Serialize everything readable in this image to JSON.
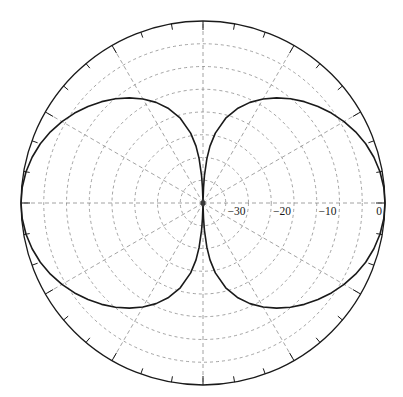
{
  "figure": {
    "name": "polar-radiation-pattern",
    "background_color": "#ffffff",
    "grid_color": "#8c8c8c",
    "curve_color": "#1a1a1a",
    "axis_color": "#1a1a1a",
    "center_x": 203,
    "center_y": 203,
    "outer_radius": 182
  },
  "chart_data": {
    "type": "line",
    "subtype": "polar",
    "title": "",
    "subtitle": "",
    "xlabel": "",
    "ylabel": "",
    "radial_axis": {
      "label": "",
      "unit": "dB",
      "tick_labels": [
        "-30",
        "-20",
        "-10",
        "0"
      ],
      "tick_values": [
        -30,
        -20,
        -10,
        0
      ],
      "tick_radii_px": [
        45.5,
        91,
        136.5,
        182
      ],
      "rlim": [
        -40,
        0
      ],
      "r_min": -40,
      "r_max": 0,
      "tick_label_angle_deg": 0,
      "minor_grid_values": [
        -35,
        -25,
        -15,
        -5
      ],
      "grid": true,
      "grid_style": "dashed"
    },
    "angular_axis": {
      "label": "",
      "unit": "deg",
      "tick_labels": [],
      "spoke_interval_deg": 30,
      "spoke_angles_deg": [
        0,
        30,
        60,
        90,
        120,
        150,
        180,
        210,
        240,
        270,
        300,
        330
      ],
      "outer_tick_interval_deg": 10,
      "direction": "counterclockwise",
      "zero_location": "E",
      "grid": true,
      "grid_style": "dashed"
    },
    "legend": {
      "show": false,
      "position": "none",
      "entries": []
    },
    "annotations": [],
    "series": [
      {
        "name": "pattern",
        "color": "#1a1a1a",
        "line_width": 1.6,
        "description": "two-lobe broadside pattern with deep nulls at 90 and 270 degrees",
        "points_deg_db": [
          [
            0,
            0.0
          ],
          [
            5,
            -0.12
          ],
          [
            10,
            -0.5
          ],
          [
            15,
            -1.12
          ],
          [
            20,
            -1.95
          ],
          [
            25,
            -3.0
          ],
          [
            30,
            -4.2
          ],
          [
            35,
            -5.55
          ],
          [
            40,
            -7.0
          ],
          [
            45,
            -8.5
          ],
          [
            50,
            -10.1
          ],
          [
            55,
            -11.8
          ],
          [
            60,
            -13.6
          ],
          [
            65,
            -15.6
          ],
          [
            70,
            -17.9
          ],
          [
            75,
            -20.7
          ],
          [
            80,
            -24.4
          ],
          [
            83,
            -27.4
          ],
          [
            85,
            -30.2
          ],
          [
            87,
            -34.0
          ],
          [
            88,
            -36.6
          ],
          [
            89,
            -39.5
          ],
          [
            90,
            -48.0
          ],
          [
            91,
            -39.5
          ],
          [
            92,
            -36.6
          ],
          [
            93,
            -34.0
          ],
          [
            95,
            -30.2
          ],
          [
            97,
            -27.4
          ],
          [
            100,
            -24.4
          ],
          [
            105,
            -20.7
          ],
          [
            110,
            -17.9
          ],
          [
            115,
            -15.6
          ],
          [
            120,
            -13.6
          ],
          [
            125,
            -11.8
          ],
          [
            130,
            -10.1
          ],
          [
            135,
            -8.5
          ],
          [
            140,
            -7.0
          ],
          [
            145,
            -5.55
          ],
          [
            150,
            -4.2
          ],
          [
            155,
            -3.0
          ],
          [
            160,
            -1.95
          ],
          [
            165,
            -1.12
          ],
          [
            170,
            -0.5
          ],
          [
            175,
            -0.12
          ],
          [
            180,
            0.0
          ],
          [
            185,
            -0.12
          ],
          [
            190,
            -0.5
          ],
          [
            195,
            -1.12
          ],
          [
            200,
            -1.95
          ],
          [
            205,
            -3.0
          ],
          [
            210,
            -4.2
          ],
          [
            215,
            -5.55
          ],
          [
            220,
            -7.0
          ],
          [
            225,
            -8.5
          ],
          [
            230,
            -10.1
          ],
          [
            235,
            -11.8
          ],
          [
            240,
            -13.6
          ],
          [
            245,
            -15.6
          ],
          [
            250,
            -17.9
          ],
          [
            255,
            -20.7
          ],
          [
            260,
            -24.4
          ],
          [
            263,
            -27.4
          ],
          [
            265,
            -30.2
          ],
          [
            267,
            -34.0
          ],
          [
            268,
            -36.6
          ],
          [
            269,
            -39.5
          ],
          [
            270,
            -48.0
          ],
          [
            271,
            -39.5
          ],
          [
            272,
            -36.6
          ],
          [
            273,
            -34.0
          ],
          [
            275,
            -30.2
          ],
          [
            277,
            -27.4
          ],
          [
            280,
            -24.4
          ],
          [
            285,
            -20.7
          ],
          [
            290,
            -17.9
          ],
          [
            295,
            -15.6
          ],
          [
            300,
            -13.6
          ],
          [
            305,
            -11.8
          ],
          [
            310,
            -10.1
          ],
          [
            315,
            -8.5
          ],
          [
            320,
            -7.0
          ],
          [
            325,
            -5.55
          ],
          [
            330,
            -4.2
          ],
          [
            335,
            -3.0
          ],
          [
            340,
            -1.95
          ],
          [
            345,
            -1.12
          ],
          [
            350,
            -0.5
          ],
          [
            355,
            -0.12
          ],
          [
            360,
            0.0
          ]
        ]
      }
    ]
  },
  "tick_labels": [
    {
      "text": "-30",
      "radius_px": 45.5,
      "value": -30
    },
    {
      "text": "-20",
      "radius_px": 91,
      "value": -20
    },
    {
      "text": "-10",
      "radius_px": 136.5,
      "value": -10
    },
    {
      "text": "0",
      "radius_px": 182,
      "value": 0
    }
  ]
}
